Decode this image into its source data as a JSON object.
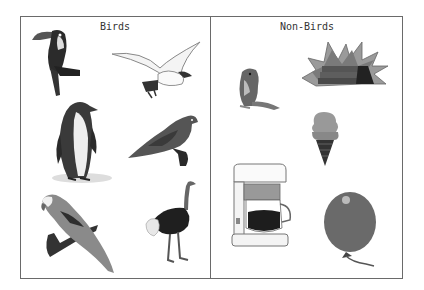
{
  "columns": [
    {
      "heading": "Birds",
      "items": [
        {
          "name": "toucan"
        },
        {
          "name": "seagull"
        },
        {
          "name": "penguin"
        },
        {
          "name": "dove"
        },
        {
          "name": "parrot"
        },
        {
          "name": "ostrich"
        }
      ]
    },
    {
      "heading": "Non-Birds",
      "items": [
        {
          "name": "hamster"
        },
        {
          "name": "firecracker-bundle"
        },
        {
          "name": "ice-cream-cone"
        },
        {
          "name": "coffee-maker"
        },
        {
          "name": "balloon"
        }
      ]
    }
  ],
  "colors": {
    "border": "#6a6a6a",
    "text": "#333333"
  }
}
